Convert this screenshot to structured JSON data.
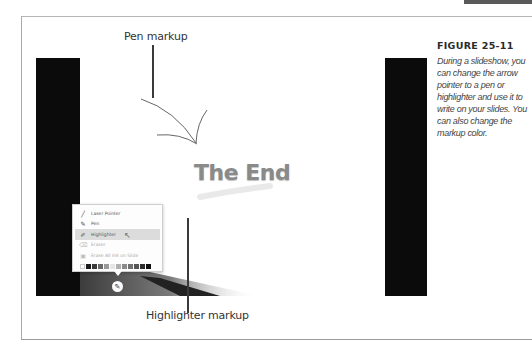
{
  "figure": {
    "heading": "FIGURE 25-11",
    "caption": "During a slideshow, you can change the arrow pointer to a pen or highlighter and use it to write on your slides. You can also change the markup color."
  },
  "callouts": {
    "pen": "Pen markup",
    "highlighter": "Highlighter markup"
  },
  "slide": {
    "title": "The End"
  },
  "ink_menu": {
    "items": [
      {
        "label": "Laser Pointer",
        "icon": "laser-pointer-icon",
        "glyph": "╱",
        "state": "normal"
      },
      {
        "label": "Pen",
        "icon": "pen-icon",
        "glyph": "✎",
        "state": "normal"
      },
      {
        "label": "Highlighter",
        "icon": "highlighter-icon",
        "glyph": "✐",
        "state": "selected"
      },
      {
        "label": "Eraser",
        "icon": "eraser-icon",
        "glyph": "⌫",
        "state": "disabled"
      },
      {
        "label": "Erase All Ink on Slide",
        "icon": "erase-all-icon",
        "glyph": "▣",
        "state": "disabled"
      }
    ],
    "swatches": [
      "#ffffff",
      "#1a1a1a",
      "#3a3a3a",
      "#6a6a6a",
      "#9a9a9a",
      "#e6e6e6",
      "#b0b0b0",
      "#8a8a8a",
      "#707070",
      "#555555",
      "#2d2d2d",
      "#101010"
    ],
    "pen_button_glyph": "✎",
    "cursor_glyph": "↖"
  },
  "colors": {
    "slide_bar": "#0b0b0b",
    "title_text": "#8a8a8a",
    "frame_border": "#a9a9a9"
  }
}
